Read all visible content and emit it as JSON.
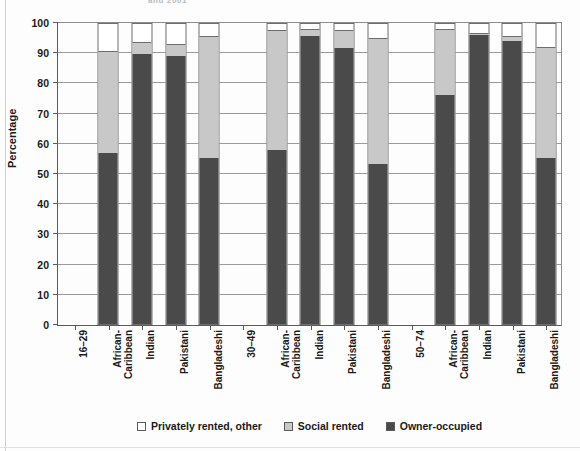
{
  "figure": {
    "title_fragment": "and 2001",
    "background": "#fdfdfd"
  },
  "colors": {
    "owner_occupied": "#4a4a4a",
    "social_rented": "#c8c8c8",
    "privately_rented": "#ffffff",
    "axis": "#5b5b5b",
    "gridline": "#9a9a9a"
  },
  "chart_data": {
    "type": "bar",
    "subtype": "stacked-100",
    "title": "",
    "xlabel": "",
    "ylabel": "Percentage",
    "ylim": [
      0,
      100
    ],
    "ytick_labels": [
      "0",
      "10",
      "20",
      "30",
      "40",
      "50",
      "60",
      "70",
      "80",
      "90",
      "100"
    ],
    "ytick_values": [
      0,
      10,
      20,
      30,
      40,
      50,
      60,
      70,
      80,
      90,
      100
    ],
    "grid": true,
    "legend_position": "bottom",
    "group_labels": [
      "16–29",
      "30–49",
      "50–74"
    ],
    "categories": [
      "African-Caribbean",
      "Indian",
      "Pakistani",
      "Bangladeshi",
      "African-Caribbean",
      "Indian",
      "Pakistani",
      "Bangladeshi",
      "African-Caribbean",
      "Indian",
      "Pakistani",
      "Bangladeshi"
    ],
    "series": [
      {
        "name": "Owner-occupied",
        "color": "#4a4a4a",
        "values": [
          57,
          90,
          89.5,
          55.5,
          58,
          96,
          92,
          53.5,
          76.5,
          96.5,
          94.5,
          55.5
        ]
      },
      {
        "name": "Social rented",
        "color": "#c8c8c8",
        "values": [
          34,
          4,
          4,
          40.5,
          40,
          2.5,
          6,
          42,
          22,
          0.5,
          1.5,
          37
        ]
      },
      {
        "name": "Privately rented, other",
        "color": "#ffffff",
        "values": [
          9,
          6,
          6.5,
          4,
          2,
          1.5,
          2,
          4.5,
          1.5,
          3,
          4,
          7.5
        ]
      }
    ],
    "bars": [
      {
        "group": "16–29",
        "category": "African-Caribbean",
        "owner_occupied": 57,
        "social_rented_top": 91
      },
      {
        "group": "16–29",
        "category": "Indian",
        "owner_occupied": 90,
        "social_rented_top": 94
      },
      {
        "group": "16–29",
        "category": "Pakistani",
        "owner_occupied": 89.5,
        "social_rented_top": 93.5
      },
      {
        "group": "16–29",
        "category": "Bangladeshi",
        "owner_occupied": 55.5,
        "social_rented_top": 96
      },
      {
        "group": "30–49",
        "category": "African-Caribbean",
        "owner_occupied": 58,
        "social_rented_top": 98
      },
      {
        "group": "30–49",
        "category": "Indian",
        "owner_occupied": 96,
        "social_rented_top": 98.5
      },
      {
        "group": "30–49",
        "category": "Pakistani",
        "owner_occupied": 92,
        "social_rented_top": 98
      },
      {
        "group": "30–49",
        "category": "Bangladeshi",
        "owner_occupied": 53.5,
        "social_rented_top": 95.5
      },
      {
        "group": "50–74",
        "category": "African-Caribbean",
        "owner_occupied": 76.5,
        "social_rented_top": 98.5
      },
      {
        "group": "50–74",
        "category": "Indian",
        "owner_occupied": 96.5,
        "social_rented_top": 97
      },
      {
        "group": "50–74",
        "category": "Pakistani",
        "owner_occupied": 94.5,
        "social_rented_top": 96
      },
      {
        "group": "50–74",
        "category": "Bangladeshi",
        "owner_occupied": 55.5,
        "social_rented_top": 92.5
      }
    ],
    "legend": [
      {
        "label": "Privately rented, other",
        "color": "#ffffff"
      },
      {
        "label": "Social rented",
        "color": "#c8c8c8"
      },
      {
        "label": "Owner-occupied",
        "color": "#4a4a4a"
      }
    ],
    "x_axis_slots": [
      {
        "type": "group",
        "lines": [
          "16–29"
        ]
      },
      {
        "type": "bar",
        "lines": [
          "African-",
          "Caribbean"
        ]
      },
      {
        "type": "bar",
        "lines": [
          "Indian"
        ]
      },
      {
        "type": "bar",
        "lines": [
          "Pakistani"
        ]
      },
      {
        "type": "bar",
        "lines": [
          "Bangladeshi"
        ]
      },
      {
        "type": "group",
        "lines": [
          "30–49"
        ]
      },
      {
        "type": "bar",
        "lines": [
          "African-",
          "Caribbean"
        ]
      },
      {
        "type": "bar",
        "lines": [
          "Indian"
        ]
      },
      {
        "type": "bar",
        "lines": [
          "Pakistani"
        ]
      },
      {
        "type": "bar",
        "lines": [
          "Bangladeshi"
        ]
      },
      {
        "type": "group",
        "lines": [
          "50–74"
        ]
      },
      {
        "type": "bar",
        "lines": [
          "African-",
          "Caribbean"
        ]
      },
      {
        "type": "bar",
        "lines": [
          "Indian"
        ]
      },
      {
        "type": "bar",
        "lines": [
          "Pakistani"
        ]
      },
      {
        "type": "bar",
        "lines": [
          "Bangladeshi"
        ]
      }
    ]
  }
}
